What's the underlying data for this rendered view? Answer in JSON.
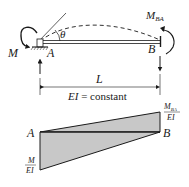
{
  "beam": {
    "label_A": "A",
    "label_B": "B",
    "moment_left": "M",
    "moment_right_main": "M",
    "moment_right_sub": "BA",
    "angle": "θ",
    "length": "L",
    "stiffness": "EI = constant",
    "stiffness_italic": "EI",
    "stiffness_rest": " = constant"
  },
  "moment_diagram": {
    "label_A": "A",
    "label_B": "B",
    "right_num_main": "M",
    "right_num_sub": "BA",
    "right_den": "EI",
    "left_num": "M",
    "left_den": "EI",
    "fill_color": "#c8c8c8",
    "line_color": "#1a1a1a"
  }
}
